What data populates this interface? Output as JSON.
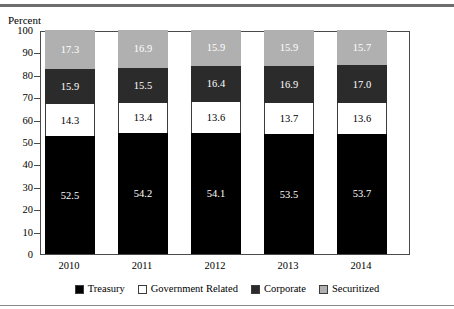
{
  "chart_data": {
    "type": "bar",
    "subtype": "stacked-bar-100",
    "title": "",
    "xlabel": "",
    "ylabel": "Percent",
    "ylim": [
      0,
      100
    ],
    "yticks": [
      0,
      10,
      20,
      30,
      40,
      50,
      60,
      70,
      80,
      90,
      100
    ],
    "ytick_labels": [
      "0",
      "10",
      "20",
      "30",
      "40",
      "50",
      "60",
      "70",
      "80",
      "90",
      "100"
    ],
    "grid": false,
    "legend_position": "bottom",
    "categories": [
      "2010",
      "2011",
      "2012",
      "2013",
      "2014"
    ],
    "series": [
      {
        "name": "Treasury",
        "color": "#000000",
        "values": [
          52.5,
          54.2,
          54.1,
          53.5,
          53.7
        ],
        "labels": [
          "52.5",
          "54.2",
          "54.1",
          "53.5",
          "53.7"
        ]
      },
      {
        "name": "Government Related",
        "color": "#ffffff",
        "values": [
          14.3,
          13.4,
          13.6,
          13.7,
          13.6
        ],
        "labels": [
          "14.3",
          "13.4",
          "13.6",
          "13.7",
          "13.6"
        ]
      },
      {
        "name": "Corporate",
        "color": "#2b2b2b",
        "values": [
          15.9,
          15.5,
          16.4,
          16.9,
          17.0
        ],
        "labels": [
          "15.9",
          "15.5",
          "16.4",
          "16.9",
          "17.0"
        ]
      },
      {
        "name": "Securitized",
        "color": "#b0b0b0",
        "values": [
          17.3,
          16.9,
          15.9,
          15.9,
          15.7
        ],
        "labels": [
          "17.3",
          "16.9",
          "15.9",
          "15.9",
          "15.7"
        ]
      }
    ]
  },
  "axis": {
    "y_title": "Percent"
  },
  "legend": {
    "items": [
      {
        "label": "Treasury",
        "swatch": "swatch-black"
      },
      {
        "label": "Government Related",
        "swatch": "swatch-white"
      },
      {
        "label": "Corporate",
        "swatch": "swatch-dark-gray"
      },
      {
        "label": "Securitized",
        "swatch": "swatch-light-gray"
      }
    ]
  }
}
